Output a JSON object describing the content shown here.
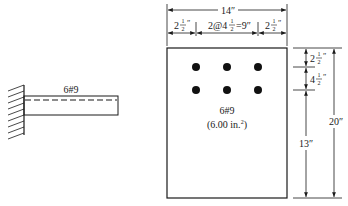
{
  "cantilever": {
    "label": "6#9"
  },
  "section": {
    "width_label": "14″",
    "edge_left_label": "2",
    "edge_right_label": "2",
    "half_num": "1",
    "half_den": "2",
    "inch": "″",
    "spacing_label_prefix": "2@4",
    "spacing_label_suffix": "=9″",
    "bars_label": "6#9",
    "area_label": "(6.00 in.",
    "area_sup": "2",
    "area_close": ")",
    "top_cover_label": "2",
    "row_spacing_label": "4",
    "bottom_label": "13″",
    "height_label": "20″"
  },
  "colors": {
    "line": "#1a1a1a",
    "background": "#ffffff"
  }
}
